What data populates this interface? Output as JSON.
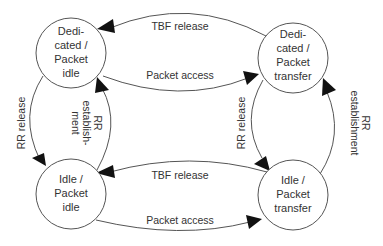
{
  "diagram": {
    "type": "state-diagram",
    "states": [
      {
        "id": "dedicated_packet_idle",
        "lines": [
          "Dedi-",
          "cated /",
          "Packet",
          "idle"
        ]
      },
      {
        "id": "dedicated_packet_transfer",
        "lines": [
          "Dedi-",
          "cated /",
          "Packet",
          "transfer"
        ]
      },
      {
        "id": "idle_packet_idle",
        "lines": [
          "Idle /",
          "Packet",
          "idle"
        ]
      },
      {
        "id": "idle_packet_transfer",
        "lines": [
          "Idle /",
          "Packet",
          "transfer"
        ]
      }
    ],
    "transitions": [
      {
        "from": "dedicated_packet_transfer",
        "to": "dedicated_packet_idle",
        "label": "TBF release"
      },
      {
        "from": "dedicated_packet_idle",
        "to": "dedicated_packet_transfer",
        "label": "Packet access"
      },
      {
        "from": "dedicated_packet_idle",
        "to": "idle_packet_idle",
        "label": "RR release"
      },
      {
        "from": "idle_packet_idle",
        "to": "dedicated_packet_idle",
        "label_lines": [
          "RR",
          "establish-",
          "ment"
        ]
      },
      {
        "from": "dedicated_packet_transfer",
        "to": "idle_packet_transfer",
        "label": "RR release"
      },
      {
        "from": "idle_packet_transfer",
        "to": "dedicated_packet_transfer",
        "label_lines": [
          "RR",
          "establishment"
        ]
      },
      {
        "from": "idle_packet_transfer",
        "to": "idle_packet_idle",
        "label": "TBF release"
      },
      {
        "from": "idle_packet_idle",
        "to": "idle_packet_transfer",
        "label": "Packet access"
      }
    ]
  }
}
